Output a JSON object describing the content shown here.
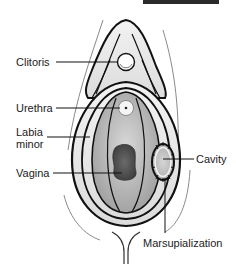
{
  "figure": {
    "type": "anatomical-diagram"
  },
  "labels": {
    "clitoris": "Clitoris",
    "urethra": "Urethra",
    "labia_minor_line1": "Labia",
    "labia_minor_line2": "minor",
    "vagina": "Vagina",
    "cavity": "Cavity",
    "marsupialization": "Marsupialization"
  },
  "colors": {
    "outline": "#111111",
    "tissue_light": "#e6e6e6",
    "tissue_mid": "#bdbdbd",
    "vagina_dark": "#4a4a4a",
    "top_bar": "#2b2b2b"
  }
}
